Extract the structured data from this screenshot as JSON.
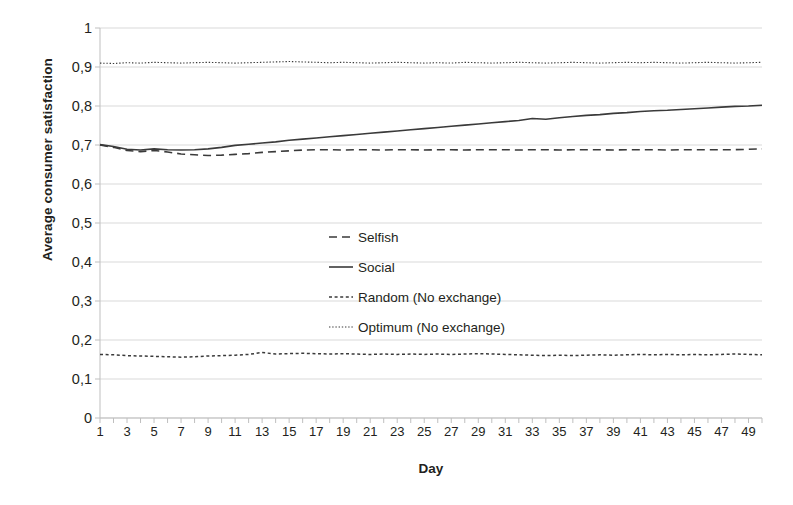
{
  "chart_data": {
    "type": "line",
    "title": "",
    "xlabel": "Day",
    "ylabel": "Average consumer satisfaction",
    "xlim": [
      1,
      50
    ],
    "ylim": [
      0,
      1
    ],
    "grid": true,
    "legend_position": "center",
    "y_tick_labels": [
      "0",
      "0,1",
      "0,2",
      "0,3",
      "0,4",
      "0,5",
      "0,6",
      "0,7",
      "0,8",
      "0,9",
      "1"
    ],
    "y_tick_values": [
      0,
      0.1,
      0.2,
      0.3,
      0.4,
      0.5,
      0.6,
      0.7,
      0.8,
      0.9,
      1
    ],
    "x_tick_labels": [
      "1",
      "3",
      "5",
      "7",
      "9",
      "11",
      "13",
      "15",
      "17",
      "19",
      "21",
      "23",
      "25",
      "27",
      "29",
      "31",
      "33",
      "35",
      "37",
      "39",
      "41",
      "43",
      "45",
      "47",
      "49"
    ],
    "x_tick_values": [
      1,
      3,
      5,
      7,
      9,
      11,
      13,
      15,
      17,
      19,
      21,
      23,
      25,
      27,
      29,
      31,
      33,
      35,
      37,
      39,
      41,
      43,
      45,
      47,
      49
    ],
    "x": [
      1,
      2,
      3,
      4,
      5,
      6,
      7,
      8,
      9,
      10,
      11,
      12,
      13,
      14,
      15,
      16,
      17,
      18,
      19,
      20,
      21,
      22,
      23,
      24,
      25,
      26,
      27,
      28,
      29,
      30,
      31,
      32,
      33,
      34,
      35,
      36,
      37,
      38,
      39,
      40,
      41,
      42,
      43,
      44,
      45,
      46,
      47,
      48,
      49,
      50
    ],
    "series": [
      {
        "name": "Selfish",
        "style": "dashed",
        "color": "#3a3a3a",
        "values": [
          0.7,
          0.694,
          0.686,
          0.683,
          0.686,
          0.682,
          0.677,
          0.675,
          0.673,
          0.674,
          0.676,
          0.678,
          0.681,
          0.683,
          0.685,
          0.687,
          0.688,
          0.688,
          0.687,
          0.688,
          0.688,
          0.687,
          0.688,
          0.688,
          0.687,
          0.688,
          0.688,
          0.687,
          0.688,
          0.688,
          0.688,
          0.687,
          0.688,
          0.688,
          0.687,
          0.688,
          0.688,
          0.688,
          0.687,
          0.688,
          0.688,
          0.688,
          0.687,
          0.688,
          0.688,
          0.688,
          0.688,
          0.688,
          0.689,
          0.69
        ]
      },
      {
        "name": "Social",
        "style": "solid",
        "color": "#3a3a3a",
        "values": [
          0.701,
          0.696,
          0.689,
          0.687,
          0.69,
          0.688,
          0.687,
          0.688,
          0.69,
          0.694,
          0.699,
          0.702,
          0.705,
          0.708,
          0.712,
          0.715,
          0.718,
          0.721,
          0.724,
          0.727,
          0.73,
          0.733,
          0.736,
          0.739,
          0.742,
          0.745,
          0.748,
          0.751,
          0.754,
          0.757,
          0.76,
          0.763,
          0.768,
          0.766,
          0.77,
          0.773,
          0.776,
          0.778,
          0.781,
          0.783,
          0.786,
          0.788,
          0.789,
          0.791,
          0.793,
          0.795,
          0.797,
          0.799,
          0.8,
          0.802
        ]
      },
      {
        "name": "Random (No exchange)",
        "style": "dotted",
        "color": "#3a3a3a",
        "values": [
          0.163,
          0.162,
          0.16,
          0.159,
          0.158,
          0.157,
          0.156,
          0.157,
          0.159,
          0.16,
          0.161,
          0.163,
          0.168,
          0.164,
          0.165,
          0.166,
          0.165,
          0.164,
          0.165,
          0.164,
          0.163,
          0.164,
          0.163,
          0.164,
          0.163,
          0.164,
          0.163,
          0.164,
          0.165,
          0.164,
          0.163,
          0.162,
          0.161,
          0.16,
          0.161,
          0.16,
          0.161,
          0.162,
          0.161,
          0.162,
          0.163,
          0.162,
          0.163,
          0.162,
          0.163,
          0.162,
          0.163,
          0.164,
          0.163,
          0.162
        ]
      },
      {
        "name": "Optimum (No exchange)",
        "style": "fine-dotted",
        "color": "#3a3a3a",
        "values": [
          0.91,
          0.909,
          0.911,
          0.91,
          0.912,
          0.911,
          0.91,
          0.911,
          0.912,
          0.911,
          0.91,
          0.911,
          0.912,
          0.913,
          0.914,
          0.913,
          0.912,
          0.911,
          0.912,
          0.911,
          0.91,
          0.911,
          0.912,
          0.911,
          0.91,
          0.911,
          0.91,
          0.912,
          0.911,
          0.91,
          0.911,
          0.912,
          0.911,
          0.91,
          0.911,
          0.912,
          0.911,
          0.91,
          0.911,
          0.912,
          0.911,
          0.912,
          0.911,
          0.91,
          0.911,
          0.912,
          0.911,
          0.91,
          0.911,
          0.912
        ]
      }
    ]
  },
  "legend": [
    {
      "label": "Selfish"
    },
    {
      "label": "Social"
    },
    {
      "label": "Random (No exchange)"
    },
    {
      "label": "Optimum (No exchange)"
    }
  ],
  "colors": {
    "line": "#3a3a3a",
    "grid": "#d9d9d9",
    "axis": "#bfbfbf",
    "text": "#231f20"
  }
}
